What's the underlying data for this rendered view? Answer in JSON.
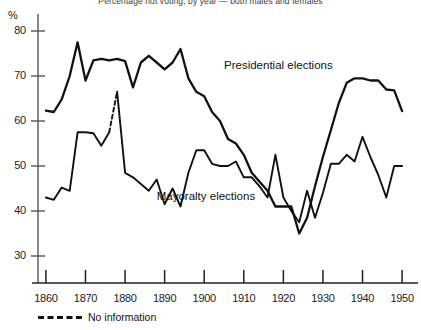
{
  "chart_data": {
    "type": "line",
    "title": "Percentage not voting, by year — both males and females",
    "xlabel": "",
    "ylabel": "%",
    "xlim": [
      1858,
      1952
    ],
    "ylim": [
      24,
      82
    ],
    "yticks": [
      30,
      40,
      50,
      60,
      70,
      80
    ],
    "xticks": [
      1860,
      1870,
      1880,
      1890,
      1900,
      1910,
      1920,
      1930,
      1940,
      1950
    ],
    "grid": false,
    "legend_position": "inline-annotations",
    "annotations": [
      {
        "text": "Presidential elections",
        "x": 1905,
        "y": 72
      },
      {
        "text": "Mayoralty elections",
        "x": 1888,
        "y": 43
      }
    ],
    "legend": [
      {
        "label": "No information",
        "style": "dashed"
      }
    ],
    "series": [
      {
        "name": "Presidential elections",
        "style": "solid",
        "x": [
          1860,
          1862,
          1864,
          1866,
          1868,
          1870,
          1872,
          1874,
          1876,
          1878,
          1880,
          1882,
          1884,
          1886,
          1888,
          1890,
          1892,
          1894,
          1896,
          1898,
          1900,
          1902,
          1904,
          1906,
          1908,
          1910,
          1912,
          1914,
          1916,
          1918,
          1920,
          1922,
          1924,
          1926,
          1928,
          1930,
          1932,
          1934,
          1936,
          1938,
          1940,
          1942,
          1944,
          1946,
          1948,
          1950
        ],
        "values": [
          62.3,
          62.0,
          64.8,
          70.0,
          77.5,
          69.0,
          73.5,
          73.8,
          73.5,
          73.8,
          73.3,
          67.5,
          73.0,
          74.5,
          73.0,
          71.5,
          73.0,
          76.0,
          69.5,
          66.5,
          65.5,
          62.0,
          60.0,
          56.0,
          55.0,
          52.5,
          48.5,
          46.5,
          44.5,
          41.0,
          41.0,
          41.0,
          35.0,
          38.5,
          45.5,
          52.0,
          58.0,
          64.0,
          68.5,
          69.5,
          69.5,
          69.0,
          69.0,
          67.0,
          66.8,
          62.2
        ]
      },
      {
        "name": "Mayoralty elections",
        "style": "solid-with-gaps",
        "x": [
          1860,
          1862,
          1864,
          1866,
          1868,
          1870,
          1872,
          1874,
          1876,
          1878,
          1880,
          1882,
          1884,
          1886,
          1888,
          1890,
          1892,
          1894,
          1896,
          1898,
          1900,
          1902,
          1904,
          1906,
          1908,
          1910,
          1912,
          1914,
          1916,
          1918,
          1920,
          1922,
          1924,
          1926,
          1928,
          1930,
          1932,
          1934,
          1936,
          1938,
          1940,
          1942,
          1944,
          1946,
          1948,
          1950
        ],
        "values": [
          43.0,
          42.5,
          45.2,
          44.5,
          57.5,
          57.5,
          57.3,
          54.5,
          57.5,
          66.5,
          48.5,
          47.5,
          46.0,
          44.5,
          47.0,
          41.5,
          45.0,
          41.0,
          48.5,
          53.5,
          53.5,
          50.5,
          50.0,
          50.0,
          51.0,
          47.5,
          47.5,
          45.5,
          43.0,
          52.5,
          43.0,
          40.0,
          37.5,
          44.5,
          38.5,
          44.0,
          50.5,
          50.5,
          52.5,
          51.0,
          56.5,
          52.0,
          48.0,
          43.0,
          50.0,
          50.0
        ],
        "dashed_segments": [
          [
            1876,
            1878
          ],
          [
            1892,
            1896
          ]
        ]
      }
    ]
  }
}
